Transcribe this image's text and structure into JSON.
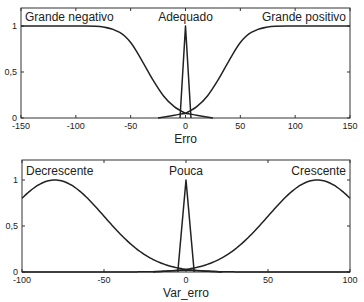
{
  "chart_data": [
    {
      "type": "line",
      "title": "",
      "xlabel": "Erro",
      "ylabel": "",
      "xlim": [
        -150,
        150
      ],
      "ylim": [
        0,
        1.2
      ],
      "xticks": [
        -150,
        -100,
        -50,
        0,
        50,
        100,
        150
      ],
      "xtick_labels": [
        "-150",
        "-100",
        "-50",
        "0",
        "50",
        "100",
        "150"
      ],
      "yticks": [
        0,
        0.5,
        1
      ],
      "ytick_labels": [
        "0",
        "0,5",
        "1"
      ],
      "grid": false,
      "legend": "none",
      "annotations": [
        {
          "text": "Grande negativo",
          "x": -150,
          "y": 1.1
        },
        {
          "text": "Adequado",
          "x": 0,
          "y": 1.1
        },
        {
          "text": "Grande positivo",
          "x": 150,
          "y": 1.1
        }
      ],
      "series": [
        {
          "name": "Grande negativo",
          "shape": "z-sigmoid",
          "x": [
            -150,
            -100,
            -75,
            -60,
            -50,
            -40,
            -30,
            -20,
            -10,
            0
          ],
          "values": [
            1,
            1,
            0.99,
            0.93,
            0.82,
            0.63,
            0.42,
            0.24,
            0.12,
            0.05
          ]
        },
        {
          "name": "Adequado",
          "shape": "triangle",
          "x": [
            -5,
            0,
            5
          ],
          "values": [
            0,
            1,
            0
          ]
        },
        {
          "name": "Adequado (base)",
          "shape": "bump",
          "x": [
            -25,
            -10,
            0,
            10,
            25
          ],
          "values": [
            0,
            0.03,
            0.05,
            0.03,
            0
          ]
        },
        {
          "name": "Grande positivo",
          "shape": "s-sigmoid",
          "x": [
            0,
            10,
            20,
            30,
            40,
            50,
            60,
            75,
            100,
            150
          ],
          "values": [
            0.05,
            0.12,
            0.24,
            0.42,
            0.63,
            0.82,
            0.93,
            0.99,
            1,
            1
          ]
        }
      ]
    },
    {
      "type": "line",
      "title": "",
      "xlabel": "Var_erro",
      "ylabel": "",
      "xlim": [
        -100,
        100
      ],
      "ylim": [
        0,
        1.2
      ],
      "xticks": [
        -100,
        -50,
        0,
        50,
        100
      ],
      "xtick_labels": [
        "-100",
        "-50",
        "0",
        "50",
        "100"
      ],
      "yticks": [
        0,
        0.5,
        1
      ],
      "ytick_labels": [
        "0",
        "0,5",
        "1"
      ],
      "grid": false,
      "legend": "none",
      "annotations": [
        {
          "text": "Decrescente",
          "x": -100,
          "y": 1.1
        },
        {
          "text": "Pouca",
          "x": 0,
          "y": 1.1
        },
        {
          "text": "Crescente",
          "x": 100,
          "y": 1.1
        }
      ],
      "series": [
        {
          "name": "Decrescente",
          "shape": "gaussian",
          "center": -80,
          "sigma": 30,
          "x": [
            -100,
            -80,
            -60,
            -40,
            -20,
            0
          ],
          "values": [
            0.8,
            1,
            0.8,
            0.41,
            0.14,
            0.03
          ]
        },
        {
          "name": "Pouca",
          "shape": "triangle",
          "x": [
            -5,
            0,
            5
          ],
          "values": [
            0,
            1,
            0
          ]
        },
        {
          "name": "Pouca (base)",
          "shape": "bump",
          "x": [
            -20,
            0,
            22
          ],
          "values": [
            0,
            0.02,
            0
          ]
        },
        {
          "name": "Crescente",
          "shape": "gaussian",
          "center": 80,
          "sigma": 30,
          "x": [
            0,
            20,
            40,
            60,
            80,
            100
          ],
          "values": [
            0.03,
            0.14,
            0.41,
            0.8,
            1,
            0.8
          ]
        }
      ]
    }
  ],
  "plots": [
    {
      "box": {
        "left": 21,
        "right": 350,
        "top": 8,
        "bottom": 118
      },
      "y_one_px": 26
    },
    {
      "box": {
        "left": 22,
        "right": 350,
        "top": 160,
        "bottom": 272
      },
      "y_one_px": 180
    }
  ],
  "colors": {
    "line": "#222222",
    "axis": "#333333",
    "text": "#222222"
  }
}
